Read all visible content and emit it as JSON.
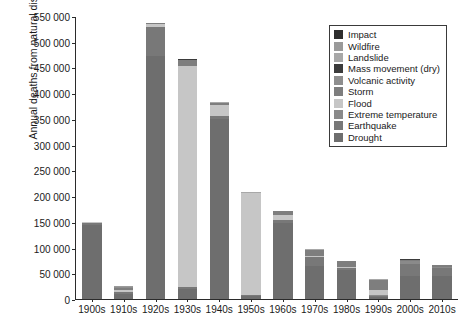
{
  "chart_data": {
    "type": "bar",
    "subtype": "stacked-bar",
    "title": "",
    "xlabel": "",
    "ylabel": "Annual deaths from natural disasters",
    "categories": [
      "1900s",
      "1910s",
      "1920s",
      "1930s",
      "1940s",
      "1950s",
      "1960s",
      "1970s",
      "1980s",
      "1990s",
      "2000s",
      "2010s"
    ],
    "ylim": [
      0,
      550000
    ],
    "yticks": [
      0,
      50000,
      100000,
      150000,
      200000,
      250000,
      300000,
      350000,
      400000,
      450000,
      500000,
      550000
    ],
    "ytick_labels": [
      "0",
      "50 000",
      "100 000",
      "150 000",
      "200 000",
      "250 000",
      "300 000",
      "350 000",
      "400 000",
      "450 000",
      "500 000",
      "550 000"
    ],
    "grid": false,
    "legend_position": "top-right",
    "series": [
      {
        "name": "Drought",
        "color": "#6e6e6e",
        "values": [
          144000,
          9000,
          472000,
          19000,
          350000,
          5000,
          148000,
          65000,
          56000,
          3000,
          45000,
          44000
        ]
      },
      {
        "name": "Earthquake",
        "color": "#787878",
        "values": [
          4000,
          5000,
          57000,
          5000,
          6000,
          3000,
          5000,
          16000,
          4000,
          3000,
          24000,
          16000
        ]
      },
      {
        "name": "Extreme temperature",
        "color": "#8a8a8a",
        "values": [
          300,
          400,
          200,
          300,
          300,
          200,
          300,
          500,
          400,
          1000,
          4000,
          1500
        ]
      },
      {
        "name": "Flood",
        "color": "#c6c6c6",
        "values": [
          500,
          3000,
          5000,
          428000,
          20000,
          197000,
          10000,
          3000,
          2000,
          10000,
          700,
          900
        ]
      },
      {
        "name": "Storm",
        "color": "#7e7e7e",
        "values": [
          900,
          5000,
          2000,
          13000,
          5000,
          1500,
          7000,
          11000,
          11000,
          20000,
          3000,
          3000
        ]
      },
      {
        "name": "Volcanic activity",
        "color": "#8e8e8e",
        "values": [
          200,
          1500,
          300,
          300,
          300,
          200,
          300,
          300,
          400,
          200,
          100,
          100
        ]
      },
      {
        "name": "Mass movement (dry)",
        "color": "#3b3b3b",
        "values": [
          100,
          100,
          100,
          100,
          100,
          100,
          100,
          100,
          100,
          100,
          100,
          100
        ]
      },
      {
        "name": "Landslide",
        "color": "#a8a8a8",
        "values": [
          200,
          300,
          300,
          500,
          600,
          400,
          600,
          700,
          700,
          800,
          900,
          700
        ]
      },
      {
        "name": "Wildfire",
        "color": "#9a9a9a",
        "values": [
          100,
          200,
          100,
          100,
          100,
          100,
          100,
          100,
          100,
          100,
          100,
          100
        ]
      },
      {
        "name": "Impact",
        "color": "#2e2e2e",
        "values": [
          0,
          0,
          0,
          0,
          0,
          0,
          0,
          0,
          0,
          0,
          0,
          0
        ]
      }
    ],
    "totals": [
      150300,
      24500,
      537000,
      466300,
      382400,
      207500,
      171400,
      96700,
      74700,
      38200,
      77900,
      66400
    ]
  },
  "legend": {
    "items": [
      {
        "label": "Impact",
        "color": "#2e2e2e"
      },
      {
        "label": "Wildfire",
        "color": "#9a9a9a"
      },
      {
        "label": "Landslide",
        "color": "#a8a8a8"
      },
      {
        "label": "Mass movement (dry)",
        "color": "#3b3b3b"
      },
      {
        "label": "Volcanic activity",
        "color": "#8e8e8e"
      },
      {
        "label": "Storm",
        "color": "#7e7e7e"
      },
      {
        "label": "Flood",
        "color": "#c6c6c6"
      },
      {
        "label": "Extreme temperature",
        "color": "#8a8a8a"
      },
      {
        "label": "Earthquake",
        "color": "#787878"
      },
      {
        "label": "Drought",
        "color": "#6e6e6e"
      }
    ]
  }
}
